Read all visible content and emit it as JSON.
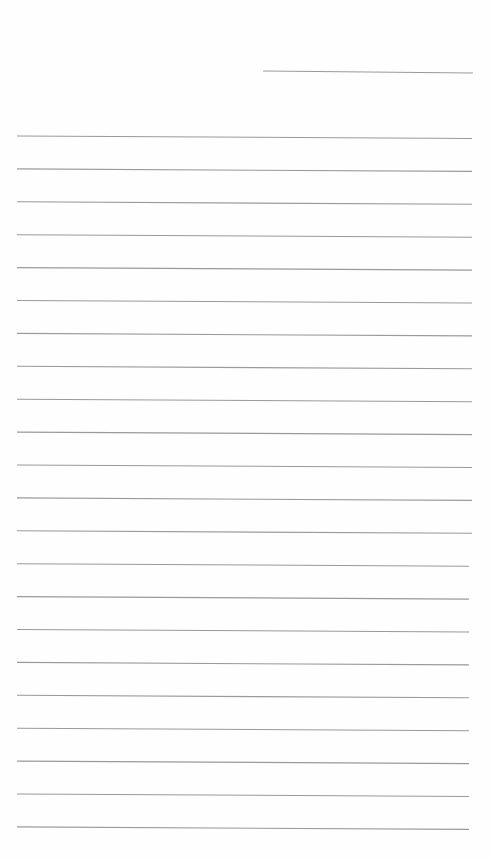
{
  "page": {
    "type": "blank lined paper",
    "background_color": "#fefefe",
    "line_color": "#9a9a9a"
  },
  "header_line": {
    "x1": 263,
    "y1": 71,
    "x2": 473,
    "y2": 73
  },
  "ruled_lines": {
    "count": 22,
    "x1": 17,
    "x2": 472,
    "first_y": 136,
    "spacing": 32.9,
    "tilt": 2.5
  }
}
